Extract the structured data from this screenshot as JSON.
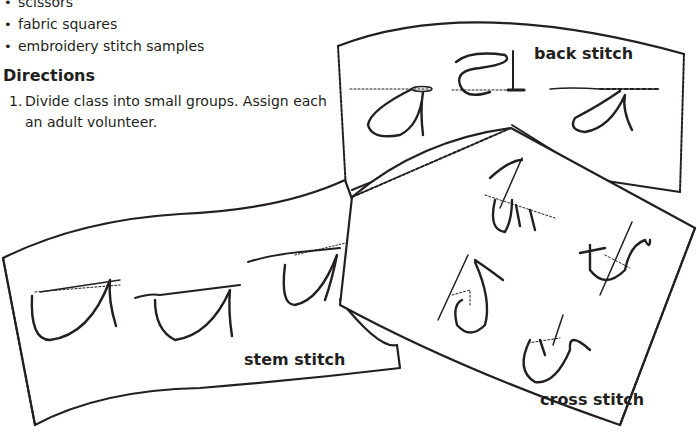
{
  "materials": {
    "items": [
      {
        "bullet": "•",
        "label": "scissors"
      },
      {
        "bullet": "•",
        "label": "fabric squares"
      },
      {
        "bullet": "•",
        "label": "embroidery stitch samples"
      }
    ]
  },
  "directions": {
    "title": "Directions",
    "steps": [
      {
        "number": "1.",
        "text": "Divide class into small groups. Assign each an adult volunteer."
      }
    ]
  },
  "illustrations": {
    "back_stitch": {
      "label": "back stitch"
    },
    "stem_stitch": {
      "label": "stem stitch"
    },
    "cross_stitch": {
      "label": "cross stitch"
    }
  }
}
